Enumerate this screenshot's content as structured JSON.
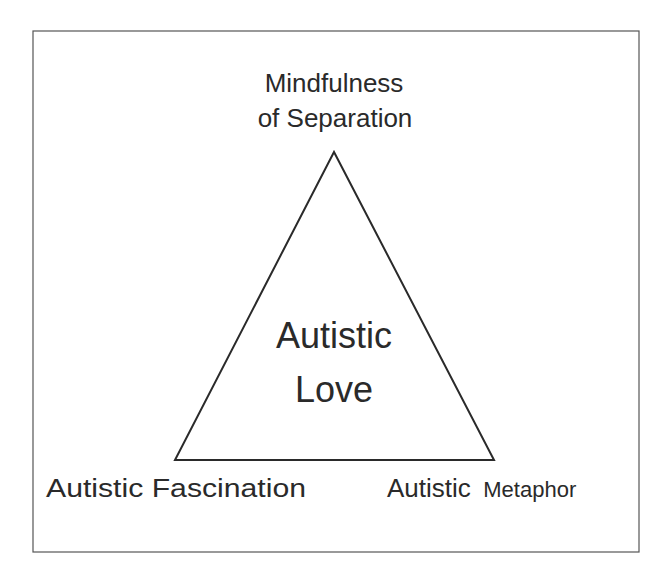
{
  "diagram": {
    "type": "triangle",
    "center_label": {
      "line1": "Autistic",
      "line2": "Love"
    },
    "vertices": {
      "top": {
        "line1": "Mindfulness",
        "line2": "of Separation"
      },
      "bottom_left": {
        "label": "Autistic Fascination"
      },
      "bottom_right": {
        "part1": "Autistic",
        "part2": "Metaphor"
      }
    }
  },
  "colors": {
    "stroke": "#2a2a2a",
    "frame": "#555555",
    "background": "#ffffff"
  }
}
